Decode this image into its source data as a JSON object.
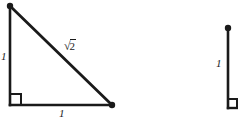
{
  "figure": {
    "stroke_color": "#1a1a1a",
    "background_color": "#ffffff",
    "canvas": {
      "width": 238,
      "height": 124
    }
  },
  "triangle": {
    "name": "isosceles-right-triangle",
    "vertices": {
      "top": {
        "x": 10,
        "y": 6
      },
      "bottom_left": {
        "x": 10,
        "y": 105
      },
      "bottom_right": {
        "x": 112,
        "y": 105
      }
    },
    "labels": {
      "vertical_leg": "1",
      "horizontal_leg": "1",
      "hypotenuse_radical": "√",
      "hypotenuse_radicand": "2",
      "hypotenuse_full": "√2"
    },
    "right_angle_at": "bottom_left"
  },
  "second_figure": {
    "name": "partial-figure-vertical-segment",
    "segment": {
      "x": 228,
      "y_top": 27,
      "y_bottom": 108
    },
    "labels": {
      "vertical_leg": "1"
    },
    "right_angle_at": "bottom"
  }
}
